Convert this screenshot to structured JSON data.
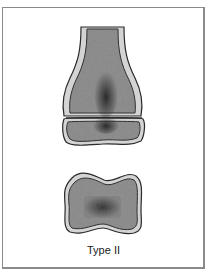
{
  "figure": {
    "caption": "Type II",
    "colors": {
      "bone_fill": "#8f8f8f",
      "cortex": "#d4d4d4",
      "outline": "#2a2a2a",
      "lesion": "#3a3a3a",
      "frame": "#8a8a8a",
      "background": "#ffffff"
    },
    "parts": [
      "distal-shaft-metaphysis",
      "epiphysis",
      "growth-plate",
      "detached-fragment-cross-section"
    ]
  }
}
